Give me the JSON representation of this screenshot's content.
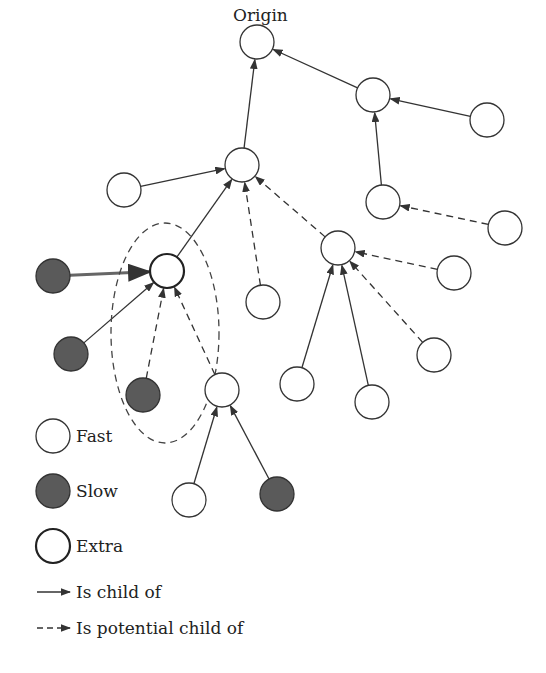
{
  "title": "Origin",
  "colors": {
    "fast_fill": "#ffffff",
    "slow_fill": "#5a5a5a",
    "stroke": "#333333",
    "bg": "#ffffff"
  },
  "nodes": [
    {
      "id": "origin",
      "type": "fast",
      "x": 257,
      "y": 42
    },
    {
      "id": "n2",
      "type": "fast",
      "x": 373,
      "y": 95
    },
    {
      "id": "n3",
      "type": "fast",
      "x": 487,
      "y": 120
    },
    {
      "id": "n4",
      "type": "fast",
      "x": 383,
      "y": 202
    },
    {
      "id": "n5",
      "type": "fast",
      "x": 505,
      "y": 228
    },
    {
      "id": "a",
      "type": "fast",
      "x": 242,
      "y": 165
    },
    {
      "id": "b",
      "type": "fast",
      "x": 124,
      "y": 190
    },
    {
      "id": "c",
      "type": "extra",
      "x": 167,
      "y": 271
    },
    {
      "id": "d",
      "type": "fast",
      "x": 338,
      "y": 248
    },
    {
      "id": "e",
      "type": "fast",
      "x": 263,
      "y": 302
    },
    {
      "id": "f",
      "type": "fast",
      "x": 454,
      "y": 273
    },
    {
      "id": "g",
      "type": "fast",
      "x": 434,
      "y": 355
    },
    {
      "id": "h",
      "type": "fast",
      "x": 297,
      "y": 384
    },
    {
      "id": "i",
      "type": "fast",
      "x": 372,
      "y": 402
    },
    {
      "id": "s1",
      "type": "slow",
      "x": 53,
      "y": 276
    },
    {
      "id": "s2",
      "type": "slow",
      "x": 71,
      "y": 354
    },
    {
      "id": "s3",
      "type": "slow",
      "x": 143,
      "y": 395
    },
    {
      "id": "j",
      "type": "fast",
      "x": 222,
      "y": 390
    },
    {
      "id": "k",
      "type": "fast",
      "x": 189,
      "y": 500
    },
    {
      "id": "s4",
      "type": "slow",
      "x": 277,
      "y": 494
    }
  ],
  "edges": [
    {
      "from": "n2",
      "to": "origin",
      "style": "solid"
    },
    {
      "from": "n3",
      "to": "n2",
      "style": "solid"
    },
    {
      "from": "n4",
      "to": "n2",
      "style": "solid"
    },
    {
      "from": "n5",
      "to": "n4",
      "style": "dashed"
    },
    {
      "from": "a",
      "to": "origin",
      "style": "solid"
    },
    {
      "from": "b",
      "to": "a",
      "style": "solid"
    },
    {
      "from": "c",
      "to": "a",
      "style": "solid"
    },
    {
      "from": "e",
      "to": "a",
      "style": "dashed"
    },
    {
      "from": "d",
      "to": "a",
      "style": "dashed"
    },
    {
      "from": "f",
      "to": "d",
      "style": "dashed"
    },
    {
      "from": "g",
      "to": "d",
      "style": "dashed"
    },
    {
      "from": "h",
      "to": "d",
      "style": "solid"
    },
    {
      "from": "i",
      "to": "d",
      "style": "solid"
    },
    {
      "from": "s1",
      "to": "c",
      "style": "double"
    },
    {
      "from": "s2",
      "to": "c",
      "style": "solid"
    },
    {
      "from": "s3",
      "to": "c",
      "style": "dashed"
    },
    {
      "from": "j",
      "to": "c",
      "style": "dashed"
    },
    {
      "from": "k",
      "to": "j",
      "style": "solid"
    },
    {
      "from": "s4",
      "to": "j",
      "style": "solid"
    }
  ],
  "group_ellipse": {
    "cx": 165,
    "cy": 333,
    "rx": 54,
    "ry": 110
  },
  "legend": {
    "fast": "Fast",
    "slow": "Slow",
    "extra": "Extra",
    "child": "Is child of",
    "potential": "Is potential child of"
  }
}
